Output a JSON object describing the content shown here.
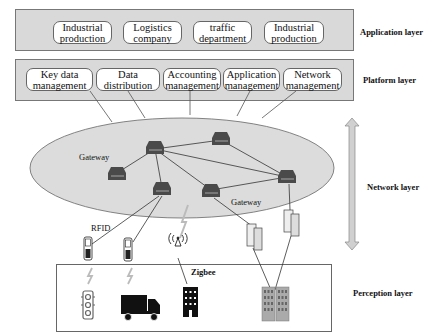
{
  "application_layer": {
    "label": "Application layer",
    "items": [
      {
        "line1": "Industrial",
        "line2": "production"
      },
      {
        "line1": "Logistics",
        "line2": "company"
      },
      {
        "line1": "traffic",
        "line2": "department"
      },
      {
        "line1": "Industrial",
        "line2": "production"
      }
    ]
  },
  "platform_layer": {
    "label": "Platform layer",
    "items": [
      {
        "line1": "Key data",
        "line2": "management"
      },
      {
        "line1": "Data",
        "line2": "distribution"
      },
      {
        "line1": "Accounting",
        "line2": "management"
      },
      {
        "line1": "Application",
        "line2": "management"
      },
      {
        "line1": "Network",
        "line2": "management"
      }
    ]
  },
  "network_layer": {
    "label": "Network layer",
    "gateway_labels": [
      "Gateway",
      "Gateway"
    ],
    "nodes": [
      "router-1",
      "router-2",
      "router-3",
      "router-4",
      "router-5",
      "router-6"
    ]
  },
  "perception_layer": {
    "label": "Perception layer",
    "rfid_label": "RFID",
    "zigbee_label": "Zigbee",
    "devices": [
      "traffic-light",
      "truck",
      "building",
      "office-towers"
    ]
  },
  "colors": {
    "layer_fill": "#d9d9d9",
    "ellipse_fill": "#dcdcdc",
    "router": "#4a4a4a",
    "arrow_fill": "#d0d0d0"
  }
}
